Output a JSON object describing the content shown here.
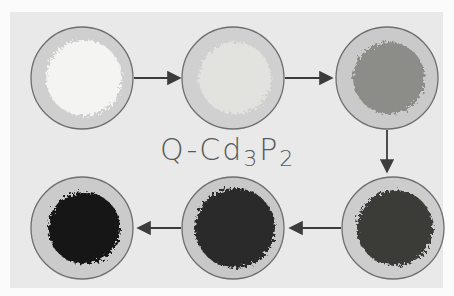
{
  "title": {
    "prefix": "Q-Cd",
    "sub1": "3",
    "mid": "P",
    "sub2": "2"
  },
  "samples": [
    {
      "name": "sample-1",
      "powder_color": "#f4f4f2",
      "dish_color": "#cfcfcf",
      "powder_tone": "white"
    },
    {
      "name": "sample-2",
      "powder_color": "#e2e2df",
      "dish_color": "#d0d0d0",
      "powder_tone": "off-white"
    },
    {
      "name": "sample-3",
      "powder_color": "#8c8c88",
      "dish_color": "#cacaca",
      "powder_tone": "gray"
    },
    {
      "name": "sample-4",
      "powder_color": "#3a3a38",
      "dish_color": "#cdcdcd",
      "powder_tone": "dark gray"
    },
    {
      "name": "sample-5",
      "powder_color": "#2c2c2a",
      "dish_color": "#c8c8c8",
      "powder_tone": "very dark"
    },
    {
      "name": "sample-6",
      "powder_color": "#161615",
      "dish_color": "#cbcbcb",
      "powder_tone": "black"
    }
  ],
  "sequence": [
    "sample-1",
    "sample-2",
    "sample-3",
    "sample-4",
    "sample-5",
    "sample-6"
  ],
  "colors": {
    "outline": "#6e6e6e",
    "arrow": "#3c3c3c",
    "panel": "#e9e9e9"
  }
}
